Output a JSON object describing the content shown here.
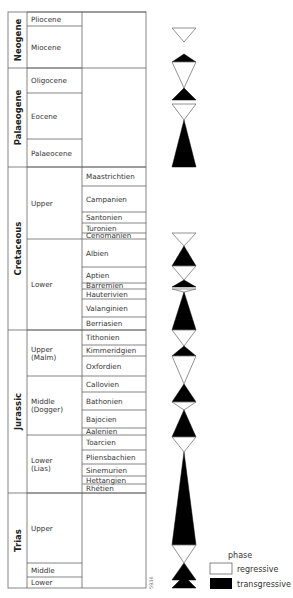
{
  "table": {
    "eras": [
      {
        "label": "Neogene",
        "y0": 12,
        "y1": 68
      },
      {
        "label": "Palaeogene",
        "y0": 68,
        "y1": 167
      },
      {
        "label": "Cretaceous",
        "y0": 167,
        "y1": 330
      },
      {
        "label": "Jurassic",
        "y0": 330,
        "y1": 493
      },
      {
        "label": "Trias",
        "y0": 493,
        "y1": 588
      }
    ],
    "epochs": [
      {
        "label": "Pliocene",
        "lines": [
          "Pliocene"
        ],
        "y0": 12,
        "y1": 26,
        "spans_stage": true
      },
      {
        "label": "Miocene",
        "lines": [
          "Miocene"
        ],
        "y0": 26,
        "y1": 68,
        "spans_stage": true
      },
      {
        "label": "Oligocene",
        "lines": [
          "Oligocene"
        ],
        "y0": 68,
        "y1": 93,
        "spans_stage": true
      },
      {
        "label": "Eocene",
        "lines": [
          "Eocene"
        ],
        "y0": 93,
        "y1": 139,
        "spans_stage": true
      },
      {
        "label": "Palaeocene",
        "lines": [
          "Palaeocene"
        ],
        "y0": 139,
        "y1": 167,
        "spans_stage": true
      },
      {
        "label": "Upper",
        "lines": [
          "Upper"
        ],
        "y0": 167,
        "y1": 239
      },
      {
        "label": "Lower",
        "lines": [
          "Lower"
        ],
        "y0": 239,
        "y1": 330
      },
      {
        "label": "Upper (Malm)",
        "lines": [
          "Upper",
          "(Malm)"
        ],
        "y0": 330,
        "y1": 376
      },
      {
        "label": "Middle (Dogger)",
        "lines": [
          "Middle",
          "(Dogger)"
        ],
        "y0": 376,
        "y1": 435
      },
      {
        "label": "Lower (Lias)",
        "lines": [
          "Lower",
          "(Lias)"
        ],
        "y0": 435,
        "y1": 493
      },
      {
        "label": "Upper",
        "lines": [
          "Upper"
        ],
        "y0": 493,
        "y1": 563
      },
      {
        "label": "Middle",
        "lines": [
          "Middle"
        ],
        "y0": 563,
        "y1": 577
      },
      {
        "label": "Lower",
        "lines": [
          "Lower"
        ],
        "y0": 577,
        "y1": 588
      }
    ],
    "stages": [
      {
        "label": "Maastrichtien",
        "y0": 167,
        "y1": 186
      },
      {
        "label": "Campanien",
        "y0": 186,
        "y1": 212
      },
      {
        "label": "Santonien",
        "y0": 212,
        "y1": 223
      },
      {
        "label": "Turonien",
        "y0": 223,
        "y1": 233
      },
      {
        "label": "Cenomanien",
        "y0": 233,
        "y1": 239
      },
      {
        "label": "Albien",
        "y0": 239,
        "y1": 267
      },
      {
        "label": "Aptien",
        "y0": 267,
        "y1": 283
      },
      {
        "label": "Barremien",
        "y0": 283,
        "y1": 289
      },
      {
        "label": "Hauterivien",
        "y0": 289,
        "y1": 299
      },
      {
        "label": "Valanginien",
        "y0": 299,
        "y1": 317
      },
      {
        "label": "Berriasien",
        "y0": 317,
        "y1": 330
      },
      {
        "label": "Tithonien",
        "y0": 330,
        "y1": 345
      },
      {
        "label": "Kimmeridgien",
        "y0": 345,
        "y1": 356
      },
      {
        "label": "Oxfordien",
        "y0": 356,
        "y1": 376
      },
      {
        "label": "Callovien",
        "y0": 376,
        "y1": 392
      },
      {
        "label": "Bathonien",
        "y0": 392,
        "y1": 410
      },
      {
        "label": "Bajocien",
        "y0": 410,
        "y1": 428
      },
      {
        "label": "Aalenien",
        "y0": 428,
        "y1": 435
      },
      {
        "label": "Toarcien",
        "y0": 435,
        "y1": 450
      },
      {
        "label": "Pliensbachien",
        "y0": 450,
        "y1": 464
      },
      {
        "label": "Sinemurien",
        "y0": 464,
        "y1": 476
      },
      {
        "label": "Hettangien",
        "y0": 476,
        "y1": 484
      },
      {
        "label": "Rhétien",
        "y0": 484,
        "y1": 493
      }
    ],
    "empty_stage_blocks": [
      {
        "y0": 12,
        "y1": 167
      },
      {
        "y0": 493,
        "y1": 588
      }
    ]
  },
  "phases": {
    "center_x": 184,
    "half_width": 12,
    "shapes": [
      {
        "type": "regressive",
        "base_y": 28,
        "apex_y": 42
      },
      {
        "type": "transgressive",
        "base_y": 62,
        "apex_y": 54
      },
      {
        "type": "regressive",
        "base_y": 62,
        "apex_y": 88
      },
      {
        "type": "transgressive",
        "base_y": 100,
        "apex_y": 88
      },
      {
        "type": "regressive",
        "base_y": 104,
        "apex_y": 120
      },
      {
        "type": "transgressive",
        "base_y": 167,
        "apex_y": 120
      },
      {
        "type": "regressive",
        "base_y": 233,
        "apex_y": 246
      },
      {
        "type": "transgressive",
        "base_y": 266,
        "apex_y": 246
      },
      {
        "type": "regressive",
        "base_y": 266,
        "apex_y": 280
      },
      {
        "type": "transgressive",
        "base_y": 287,
        "apex_y": 280
      },
      {
        "type": "regressive",
        "base_y": 289,
        "apex_y": 292
      },
      {
        "type": "transgressive",
        "base_y": 330,
        "apex_y": 292
      },
      {
        "type": "regressive",
        "base_y": 330,
        "apex_y": 346
      },
      {
        "type": "transgressive",
        "base_y": 356,
        "apex_y": 346
      },
      {
        "type": "regressive",
        "base_y": 356,
        "apex_y": 384
      },
      {
        "type": "transgressive",
        "base_y": 402,
        "apex_y": 384
      },
      {
        "type": "regressive",
        "base_y": 402,
        "apex_y": 410
      },
      {
        "type": "transgressive",
        "base_y": 437,
        "apex_y": 410
      },
      {
        "type": "regressive",
        "base_y": 437,
        "apex_y": 452
      },
      {
        "type": "transgressive",
        "base_y": 545,
        "apex_y": 452
      },
      {
        "type": "regressive",
        "base_y": 545,
        "apex_y": 563
      },
      {
        "type": "transgressive",
        "base_y": 580,
        "apex_y": 563
      },
      {
        "type": "transgressive",
        "base_y": 588,
        "apex_y": 576
      }
    ]
  },
  "legend": {
    "title": "phase",
    "items": [
      {
        "label": "regressive",
        "fill": "#ffffff"
      },
      {
        "label": "transgressive",
        "fill": "#000000"
      }
    ]
  },
  "figure_code": "5936",
  "colors": {
    "line": "#666666",
    "fill_dark": "#000000",
    "fill_light": "#ffffff"
  }
}
